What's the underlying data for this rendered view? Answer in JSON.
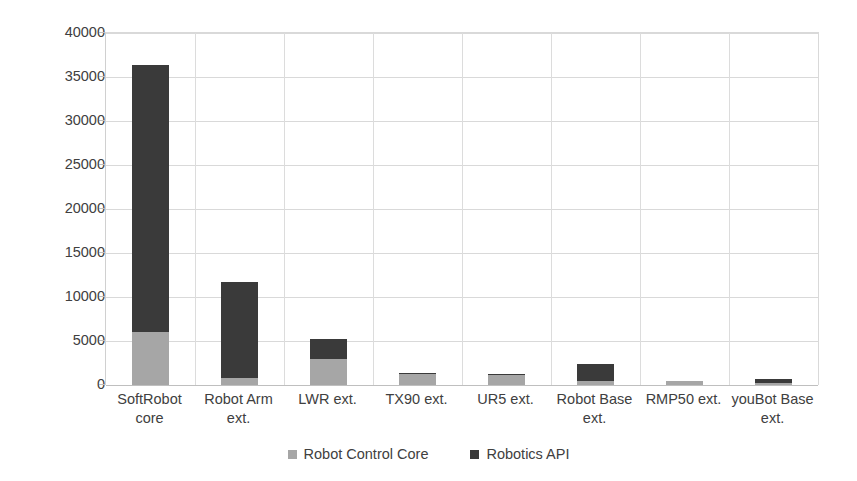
{
  "chart_data": {
    "type": "bar",
    "subtype": "stacked-column",
    "title": "",
    "xlabel": "",
    "ylabel": "",
    "ylim": [
      0,
      40000
    ],
    "ytick_step": 5000,
    "yticks": [
      "0",
      "5000",
      "10000",
      "15000",
      "20000",
      "25000",
      "30000",
      "35000",
      "40000"
    ],
    "grid": true,
    "legend_position": "bottom",
    "categories": [
      "SoftRobot core",
      "Robot Arm ext.",
      "LWR ext.",
      "TX90 ext.",
      "UR5 ext.",
      "Robot Base ext.",
      "RMP50 ext.",
      "youBot Base ext."
    ],
    "category_lines": [
      [
        "SoftRobot",
        "core"
      ],
      [
        "Robot Arm",
        "ext."
      ],
      [
        "LWR ext."
      ],
      [
        "TX90 ext."
      ],
      [
        "UR5 ext."
      ],
      [
        "Robot Base",
        "ext."
      ],
      [
        "RMP50 ext."
      ],
      [
        "youBot Base",
        "ext."
      ]
    ],
    "series": [
      {
        "name": "Robot Control Core",
        "color": "#a6a6a6",
        "values": [
          6000,
          850,
          2950,
          1250,
          1150,
          500,
          450,
          200
        ]
      },
      {
        "name": "Robotics API",
        "color": "#3a3a3a",
        "values": [
          30400,
          10850,
          2250,
          100,
          100,
          1900,
          0,
          500
        ]
      }
    ],
    "totals": [
      36400,
      11700,
      5200,
      1350,
      1250,
      2400,
      450,
      700
    ]
  },
  "legend": {
    "entries": [
      {
        "label": "Robot Control Core",
        "color": "#a6a6a6"
      },
      {
        "label": "Robotics API",
        "color": "#3a3a3a"
      }
    ]
  }
}
